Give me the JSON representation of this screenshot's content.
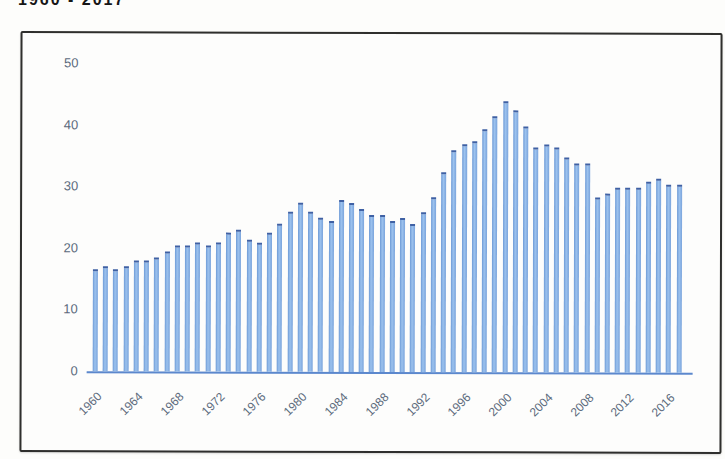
{
  "page": {
    "partial_title": "1960 - 2017"
  },
  "chart_data": {
    "type": "bar",
    "xlabel": "",
    "ylabel": "",
    "ylim": [
      0,
      50
    ],
    "grid": false,
    "legend": false,
    "bar_color": "#85aee5",
    "bar_cap_color": "#3f61a4",
    "axis_line_color": "#4a7bc8",
    "tick_label_color": "#5c6b7c",
    "yticks": [
      0,
      10,
      20,
      30,
      40,
      50
    ],
    "xtick_labels": [
      1960,
      1964,
      1968,
      1972,
      1976,
      1980,
      1984,
      1988,
      1992,
      1996,
      2000,
      2004,
      2008,
      2012,
      2016
    ],
    "x": [
      1960,
      1961,
      1962,
      1963,
      1964,
      1965,
      1966,
      1967,
      1968,
      1969,
      1970,
      1971,
      1972,
      1973,
      1974,
      1975,
      1976,
      1977,
      1978,
      1979,
      1980,
      1981,
      1982,
      1983,
      1984,
      1985,
      1986,
      1987,
      1988,
      1989,
      1990,
      1991,
      1992,
      1993,
      1994,
      1995,
      1996,
      1997,
      1998,
      1999,
      2000,
      2001,
      2002,
      2003,
      2004,
      2005,
      2006,
      2007,
      2008,
      2009,
      2010,
      2011,
      2012,
      2013,
      2014,
      2015,
      2016,
      2017
    ],
    "values": [
      16.5,
      17,
      16.5,
      17,
      18,
      18,
      18.5,
      19.5,
      20.5,
      20.5,
      21,
      20.5,
      21,
      22.5,
      23,
      21.5,
      21,
      22.5,
      24,
      26,
      27.5,
      26,
      25,
      24.5,
      28,
      27.5,
      26.5,
      25.5,
      25.5,
      24.5,
      25,
      24,
      26,
      28.5,
      32.5,
      36,
      37,
      37.5,
      39.5,
      41.5,
      44,
      42.5,
      40,
      36.5,
      37,
      36.5,
      35,
      34,
      34,
      28.5,
      29,
      30,
      30,
      30,
      31,
      31.5,
      30.5,
      30.5
    ]
  }
}
